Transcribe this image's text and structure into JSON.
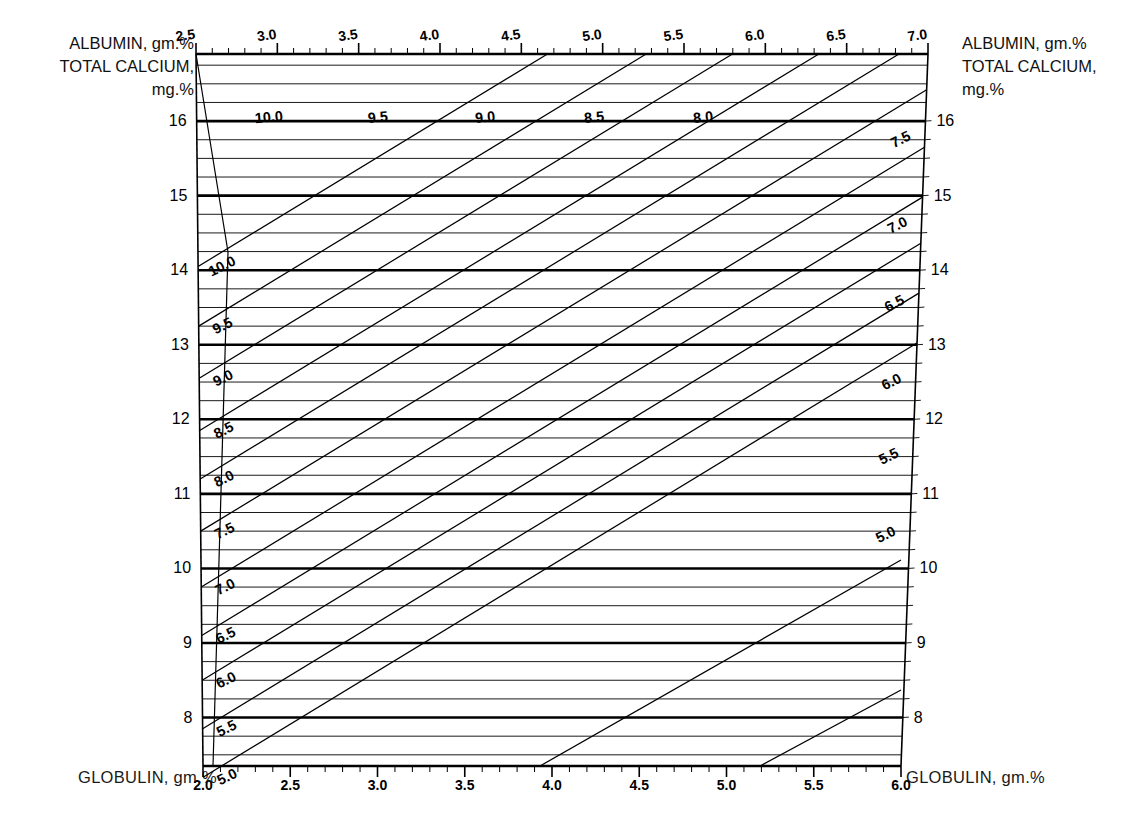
{
  "figure": {
    "kind": "nomogram",
    "background": "#ffffff",
    "ink": "#000000"
  },
  "labels": {
    "top_left_title": [
      "ALBUMIN, gm.%",
      "TOTAL CALCIUM,",
      "mg.%"
    ],
    "top_right_title": [
      "ALBUMIN, gm.%",
      "TOTAL CALCIUM,",
      "mg.%"
    ],
    "bottom_left_title": "GLOBULIN, gm.%",
    "bottom_right_title": "GLOBULIN, gm.%"
  },
  "chart_data": {
    "type": "line",
    "subtitle": "",
    "grid": true,
    "legend": "none",
    "axes": {
      "top": {
        "name": "ALBUMIN, gm.%",
        "min": 2.5,
        "max": 7.0,
        "major_ticks": [
          2.5,
          3.0,
          3.5,
          4.0,
          4.5,
          5.0,
          5.5,
          6.0,
          6.5,
          7.0
        ],
        "tick_labels": [
          "2.5",
          "3.0",
          "3.5",
          "4.0",
          "4.5",
          "5.0",
          "5.5",
          "6.0",
          "6.5",
          "7.0"
        ],
        "minor_step": 0.1
      },
      "bottom": {
        "name": "GLOBULIN, gm.%",
        "min": 2.0,
        "max": 6.0,
        "major_ticks": [
          2.0,
          2.5,
          3.0,
          3.5,
          4.0,
          4.5,
          5.0,
          5.5,
          6.0
        ],
        "tick_labels": [
          "2.0",
          "2.5",
          "3.0",
          "3.5",
          "4.0",
          "4.5",
          "5.0",
          "5.5",
          "6.0"
        ],
        "minor_step": 0.1
      },
      "left": {
        "name": "TOTAL CALCIUM, mg.%",
        "min": 8,
        "max": 16,
        "major_ticks": [
          8,
          9,
          10,
          11,
          12,
          13,
          14,
          15,
          16
        ],
        "tick_labels": [
          "8",
          "9",
          "10",
          "11",
          "12",
          "13",
          "14",
          "15",
          "16"
        ],
        "minor_step": 0.25
      },
      "right": {
        "name": "TOTAL CALCIUM, mg.%",
        "min": 8,
        "max": 16,
        "major_ticks": [
          8,
          9,
          10,
          11,
          12,
          13,
          14,
          15,
          16
        ],
        "tick_labels": [
          "8",
          "9",
          "10",
          "11",
          "12",
          "13",
          "14",
          "15",
          "16"
        ],
        "minor_step": 0.25
      }
    },
    "series": [
      {
        "name": "total-protein isopleths",
        "note": "diagonal family, labelled at both ends",
        "values": [
          10.0,
          9.5,
          9.0,
          8.5,
          8.0,
          7.5,
          7.0,
          6.5,
          6.0,
          5.5,
          5.0
        ],
        "labels_top": [
          "10.0",
          "9.5",
          "9.0",
          "8.5",
          "8.0"
        ],
        "labels_left": [
          "10.0",
          "9.5",
          "9.0",
          "8.5",
          "8.0",
          "7.5",
          "7.0",
          "6.5",
          "6.0",
          "5.5",
          "5.0"
        ],
        "labels_right": [
          "7.5",
          "7.0",
          "6.5",
          "6.0",
          "5.5",
          "5.0"
        ]
      },
      {
        "name": "calcium horizontals",
        "note": "heavy rules at whole mg.% values, light rules every 0.25",
        "values": [
          16,
          15,
          14,
          13,
          12,
          11,
          10,
          9,
          8
        ]
      }
    ],
    "diagonal_labels_top": [
      {
        "text": "10.0",
        "x": 2.95
      },
      {
        "text": "9.5",
        "x": 3.62
      },
      {
        "text": "9.0",
        "x": 4.28
      },
      {
        "text": "8.5",
        "x": 4.95
      },
      {
        "text": "8.0",
        "x": 5.62
      }
    ],
    "diagonal_labels_left": [
      {
        "text": "10.0",
        "ca": 14.05
      },
      {
        "text": "9.5",
        "ca": 13.25
      },
      {
        "text": "9.0",
        "ca": 12.55
      },
      {
        "text": "8.5",
        "ca": 11.85
      },
      {
        "text": "8.0",
        "ca": 11.2
      },
      {
        "text": "7.5",
        "ca": 10.5
      },
      {
        "text": "7.0",
        "ca": 9.75
      },
      {
        "text": "6.5",
        "ca": 9.1
      },
      {
        "text": "6.0",
        "ca": 8.5
      },
      {
        "text": "5.5",
        "ca": 7.85
      },
      {
        "text": "5.0",
        "ca": 7.2
      }
    ],
    "diagonal_labels_right": [
      {
        "text": "7.5",
        "ca": 15.75
      },
      {
        "text": "7.0",
        "ca": 14.6
      },
      {
        "text": "6.5",
        "ca": 13.55
      },
      {
        "text": "6.0",
        "ca": 12.5
      },
      {
        "text": "5.5",
        "ca": 11.5
      },
      {
        "text": "5.0",
        "ca": 10.45
      }
    ],
    "left_axis_labels": [
      "16",
      "15",
      "14",
      "13",
      "12",
      "11",
      "10",
      "9",
      "8"
    ],
    "right_axis_labels": [
      "16",
      "15",
      "14",
      "13",
      "12",
      "11",
      "10",
      "9",
      "8"
    ],
    "xlabel": "GLOBULIN, gm.%",
    "ylabel": "TOTAL CALCIUM, mg.%"
  }
}
